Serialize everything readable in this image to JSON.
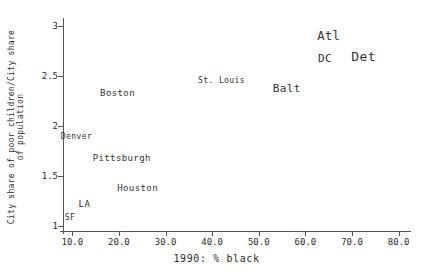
{
  "chart_data": {
    "type": "scatter",
    "title": "",
    "xlabel": "1990: % black",
    "ylabel": "City share of poor children/City share of population",
    "xlim": [
      8.0,
      82.0
    ],
    "ylim": [
      0.95,
      3.05
    ],
    "grid": false,
    "legend": "none",
    "label_mode": "text-labels-as-markers",
    "xticks": [
      "10.0",
      "20.0",
      "30.0",
      "40.0",
      "50.0",
      "60.0",
      "70.0",
      "80.0"
    ],
    "xtick_values": [
      10.0,
      20.0,
      30.0,
      40.0,
      50.0,
      60.0,
      70.0,
      80.0
    ],
    "yticks": [
      "1",
      "1.5",
      "2",
      "2.5",
      "3"
    ],
    "ytick_values": [
      1,
      1.5,
      2,
      2.5,
      3
    ],
    "points": [
      {
        "label": "SF",
        "x": 9.5,
        "y": 1.08,
        "size": 8
      },
      {
        "label": "LA",
        "x": 12.6,
        "y": 1.22,
        "size": 9
      },
      {
        "label": "Denver",
        "x": 10.9,
        "y": 1.89,
        "size": 8
      },
      {
        "label": "Houston",
        "x": 24.0,
        "y": 1.38,
        "size": 9
      },
      {
        "label": "Pittsburgh",
        "x": 20.6,
        "y": 1.68,
        "size": 9
      },
      {
        "label": "Boston",
        "x": 19.7,
        "y": 2.33,
        "size": 9
      },
      {
        "label": "St. Louis",
        "x": 42.0,
        "y": 2.45,
        "size": 8
      },
      {
        "label": "Balt",
        "x": 56.0,
        "y": 2.38,
        "size": 11
      },
      {
        "label": "Atl",
        "x": 65.0,
        "y": 2.9,
        "size": 12
      },
      {
        "label": "DC",
        "x": 64.2,
        "y": 2.68,
        "size": 11
      },
      {
        "label": "Det",
        "x": 72.5,
        "y": 2.7,
        "size": 13
      }
    ]
  },
  "colors": {
    "axis": "#555555",
    "text": "#2b2b2b",
    "point_label": "#333333",
    "background": "#ffffff"
  }
}
